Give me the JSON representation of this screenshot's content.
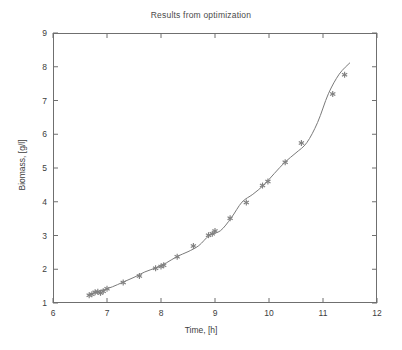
{
  "chart_data": {
    "type": "line",
    "title": "Results from optimization",
    "xlabel": "Time, [h]",
    "ylabel": "Biomass, [g/l]",
    "xlim": [
      6,
      12
    ],
    "ylim": [
      1,
      9
    ],
    "xticks": [
      6,
      7,
      8,
      9,
      10,
      11,
      12
    ],
    "yticks": [
      1,
      2,
      3,
      4,
      5,
      6,
      7,
      8,
      9
    ],
    "xtick_labels": [
      "6",
      "7",
      "8",
      "9",
      "10",
      "11",
      "12"
    ],
    "ytick_labels": [
      "1",
      "2",
      "3",
      "4",
      "5",
      "6",
      "7",
      "8",
      "9"
    ],
    "grid": false,
    "legend": null,
    "line_color": "#7a7a7a",
    "marker_color": "#808080",
    "marker": "asterisk",
    "axis_color": "#6f6f6f",
    "background": "#ffffff",
    "series": [
      {
        "name": "model fit",
        "style": "line",
        "x": [
          6.65,
          6.8,
          6.95,
          7.1,
          7.3,
          7.5,
          7.7,
          7.9,
          8.1,
          8.3,
          8.5,
          8.7,
          8.9,
          9.1,
          9.3,
          9.5,
          9.7,
          9.9,
          10.1,
          10.3,
          10.5,
          10.7,
          10.9,
          11.1,
          11.3,
          11.5
        ],
        "y": [
          1.23,
          1.32,
          1.4,
          1.48,
          1.62,
          1.76,
          1.92,
          2.04,
          2.19,
          2.38,
          2.52,
          2.7,
          3.01,
          3.14,
          3.52,
          3.99,
          4.22,
          4.49,
          4.84,
          5.18,
          5.45,
          5.75,
          6.35,
          7.2,
          7.78,
          8.12
        ]
      },
      {
        "name": "measurements",
        "style": "markers",
        "x": [
          6.67,
          6.72,
          6.78,
          6.83,
          6.88,
          6.93,
          7.0,
          7.3,
          7.6,
          7.9,
          8.0,
          8.05,
          8.3,
          8.6,
          8.88,
          8.95,
          9.0,
          9.28,
          9.58,
          9.88,
          9.98,
          10.3,
          10.6,
          11.18,
          11.4
        ],
        "y": [
          1.23,
          1.26,
          1.32,
          1.33,
          1.3,
          1.35,
          1.42,
          1.61,
          1.8,
          2.03,
          2.08,
          2.12,
          2.37,
          2.69,
          3.01,
          3.05,
          3.13,
          3.51,
          3.98,
          4.48,
          4.6,
          5.17,
          5.74,
          7.19,
          7.76
        ]
      }
    ]
  }
}
